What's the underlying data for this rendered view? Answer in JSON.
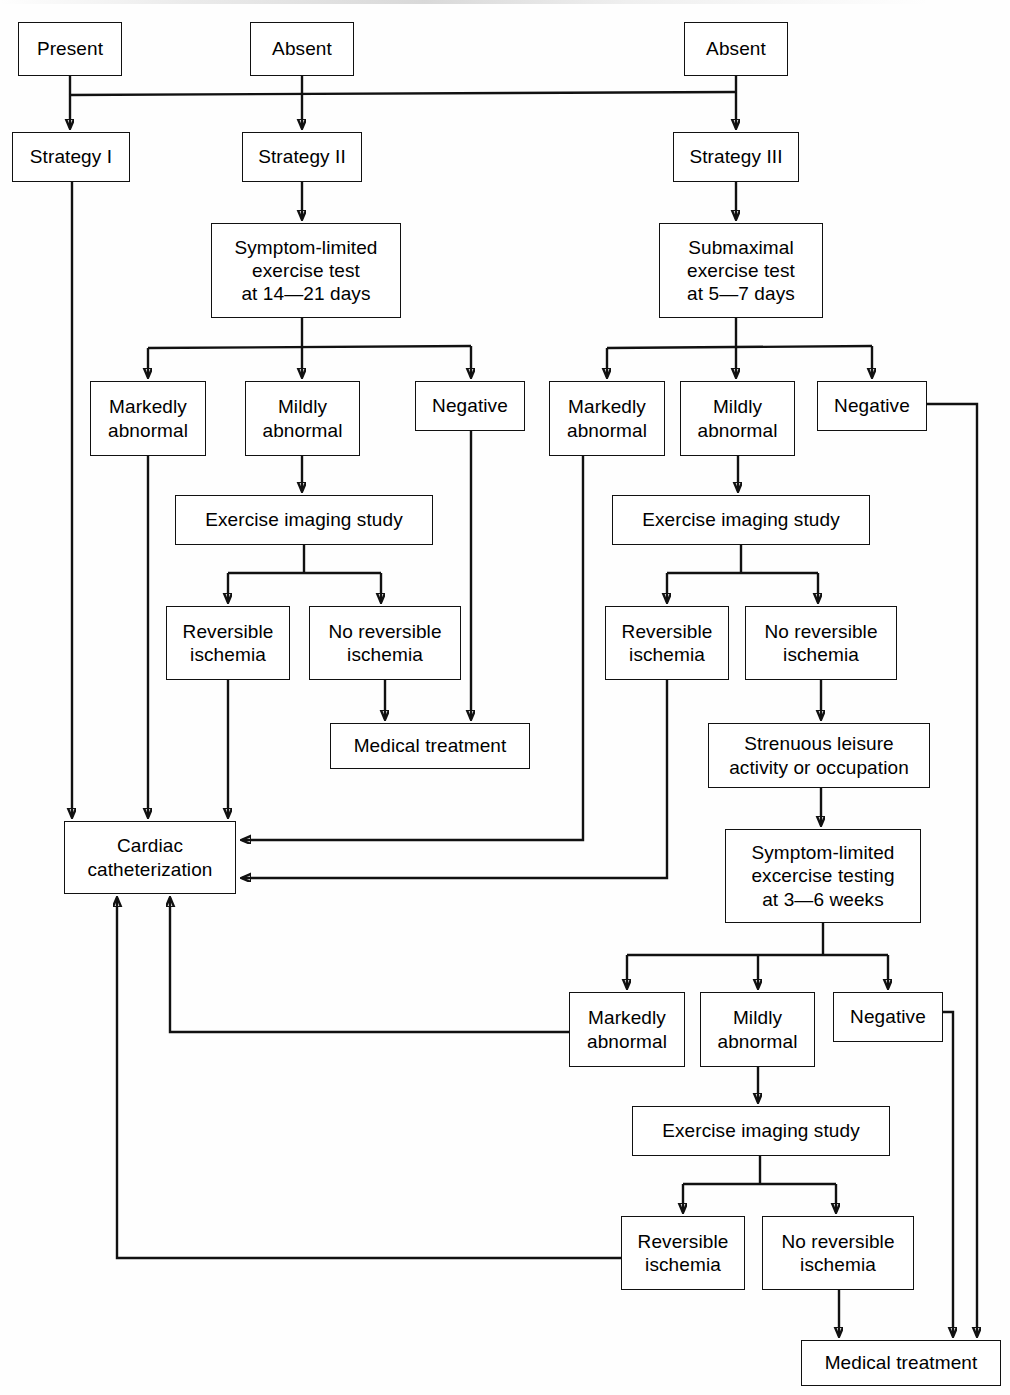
{
  "diagram": {
    "type": "flowchart",
    "nodes": [
      {
        "id": "present",
        "label": "Present",
        "x": 18,
        "y": 22,
        "w": 104,
        "h": 54
      },
      {
        "id": "absent-ii",
        "label": "Absent",
        "x": 250,
        "y": 22,
        "w": 104,
        "h": 54
      },
      {
        "id": "absent-iii",
        "label": "Absent",
        "x": 684,
        "y": 22,
        "w": 104,
        "h": 54
      },
      {
        "id": "strategy-1",
        "label": "Strategy I",
        "x": 12,
        "y": 132,
        "w": 118,
        "h": 50
      },
      {
        "id": "strategy-2",
        "label": "Strategy II",
        "x": 242,
        "y": 132,
        "w": 120,
        "h": 50
      },
      {
        "id": "strategy-3",
        "label": "Strategy III",
        "x": 673,
        "y": 132,
        "w": 126,
        "h": 50
      },
      {
        "id": "sym-limited-14",
        "label": "Symptom-limited\nexercise test\nat 14—21 days",
        "x": 211,
        "y": 223,
        "w": 190,
        "h": 95
      },
      {
        "id": "submaximal-5",
        "label": "Submaximal\nexercise test\nat 5—7 days",
        "x": 659,
        "y": 223,
        "w": 164,
        "h": 95
      },
      {
        "id": "mark-abn-2",
        "label": "Markedly\nabnormal",
        "x": 90,
        "y": 381,
        "w": 116,
        "h": 75
      },
      {
        "id": "mild-abn-2",
        "label": "Mildly\nabnormal",
        "x": 245,
        "y": 381,
        "w": 115,
        "h": 75
      },
      {
        "id": "negative-2",
        "label": "Negative",
        "x": 415,
        "y": 381,
        "w": 110,
        "h": 50
      },
      {
        "id": "mark-abn-3",
        "label": "Markedly\nabnormal",
        "x": 549,
        "y": 381,
        "w": 116,
        "h": 75
      },
      {
        "id": "mild-abn-3",
        "label": "Mildly\nabnormal",
        "x": 680,
        "y": 381,
        "w": 115,
        "h": 75
      },
      {
        "id": "negative-3",
        "label": "Negative",
        "x": 817,
        "y": 381,
        "w": 110,
        "h": 50
      },
      {
        "id": "eis-2",
        "label": "Exercise imaging study",
        "x": 175,
        "y": 495,
        "w": 258,
        "h": 50
      },
      {
        "id": "eis-3",
        "label": "Exercise imaging study",
        "x": 612,
        "y": 495,
        "w": 258,
        "h": 50
      },
      {
        "id": "rev-isch-2",
        "label": "Reversible\nischemia",
        "x": 166,
        "y": 606,
        "w": 124,
        "h": 74
      },
      {
        "id": "no-rev-isch-2",
        "label": "No reversible\nischemia",
        "x": 309,
        "y": 606,
        "w": 152,
        "h": 74
      },
      {
        "id": "rev-isch-3",
        "label": "Reversible\nischemia",
        "x": 605,
        "y": 606,
        "w": 124,
        "h": 74
      },
      {
        "id": "no-rev-isch-3",
        "label": "No reversible\nischemia",
        "x": 745,
        "y": 606,
        "w": 152,
        "h": 74
      },
      {
        "id": "med-treat-2",
        "label": "Medical treatment",
        "x": 330,
        "y": 723,
        "w": 200,
        "h": 46
      },
      {
        "id": "strenuous",
        "label": "Strenuous leisure\nactivity or occupation",
        "x": 708,
        "y": 723,
        "w": 222,
        "h": 65
      },
      {
        "id": "cardiac-cath",
        "label": "Cardiac\ncatheterization",
        "x": 64,
        "y": 821,
        "w": 172,
        "h": 73
      },
      {
        "id": "sym-limited-3",
        "label": "Symptom-limited\nexcercise testing\nat 3—6 weeks",
        "x": 725,
        "y": 829,
        "w": 196,
        "h": 94
      },
      {
        "id": "mark-abn-4",
        "label": "Markedly\nabnormal",
        "x": 569,
        "y": 992,
        "w": 116,
        "h": 75
      },
      {
        "id": "mild-abn-4",
        "label": "Mildly\nabnormal",
        "x": 700,
        "y": 992,
        "w": 115,
        "h": 75
      },
      {
        "id": "negative-4",
        "label": "Negative",
        "x": 833,
        "y": 992,
        "w": 110,
        "h": 50
      },
      {
        "id": "eis-4",
        "label": "Exercise imaging study",
        "x": 632,
        "y": 1106,
        "w": 258,
        "h": 50
      },
      {
        "id": "rev-isch-4",
        "label": "Reversible\nischemia",
        "x": 621,
        "y": 1216,
        "w": 124,
        "h": 74
      },
      {
        "id": "no-rev-isch-4",
        "label": "No reversible\nischemia",
        "x": 762,
        "y": 1216,
        "w": 152,
        "h": 74
      },
      {
        "id": "med-treat-4",
        "label": "Medical treatment",
        "x": 801,
        "y": 1340,
        "w": 200,
        "h": 46
      }
    ],
    "edges": [
      {
        "from": "present",
        "to": "strategy-1",
        "kind": "vertical-arrow"
      },
      {
        "from": "absent-ii",
        "to": "strategy-2",
        "kind": "vertical-arrow"
      },
      {
        "from": "absent-iii",
        "to": "strategy-3",
        "kind": "vertical-arrow"
      },
      {
        "from": "absent-iii",
        "to": "present",
        "kind": "horizontal-bus"
      },
      {
        "from": "strategy-2",
        "to": "sym-limited-14",
        "kind": "vertical-arrow"
      },
      {
        "from": "strategy-3",
        "to": "submaximal-5",
        "kind": "vertical-arrow"
      },
      {
        "from": "sym-limited-14",
        "to": "mark-abn-2",
        "kind": "branch"
      },
      {
        "from": "sym-limited-14",
        "to": "mild-abn-2",
        "kind": "branch"
      },
      {
        "from": "sym-limited-14",
        "to": "negative-2",
        "kind": "branch"
      },
      {
        "from": "submaximal-5",
        "to": "mark-abn-3",
        "kind": "branch"
      },
      {
        "from": "submaximal-5",
        "to": "mild-abn-3",
        "kind": "branch"
      },
      {
        "from": "submaximal-5",
        "to": "negative-3",
        "kind": "branch"
      },
      {
        "from": "mild-abn-2",
        "to": "eis-2",
        "kind": "vertical-arrow"
      },
      {
        "from": "eis-2",
        "to": "rev-isch-2",
        "kind": "branch"
      },
      {
        "from": "eis-2",
        "to": "no-rev-isch-2",
        "kind": "branch"
      },
      {
        "from": "no-rev-isch-2",
        "to": "med-treat-2",
        "kind": "vertical-arrow"
      },
      {
        "from": "negative-2",
        "to": "med-treat-2",
        "kind": "vertical-arrow"
      },
      {
        "from": "strategy-1",
        "to": "cardiac-cath",
        "kind": "vertical-arrow"
      },
      {
        "from": "mark-abn-2",
        "to": "cardiac-cath",
        "kind": "vertical-arrow"
      },
      {
        "from": "rev-isch-2",
        "to": "cardiac-cath",
        "kind": "vertical-arrow"
      },
      {
        "from": "mark-abn-3",
        "to": "cardiac-cath",
        "kind": "elbow-left"
      },
      {
        "from": "rev-isch-3",
        "to": "cardiac-cath",
        "kind": "elbow-left"
      },
      {
        "from": "mild-abn-3",
        "to": "eis-3",
        "kind": "vertical-arrow"
      },
      {
        "from": "eis-3",
        "to": "rev-isch-3",
        "kind": "branch"
      },
      {
        "from": "eis-3",
        "to": "no-rev-isch-3",
        "kind": "branch"
      },
      {
        "from": "no-rev-isch-3",
        "to": "strenuous",
        "kind": "vertical-arrow"
      },
      {
        "from": "strenuous",
        "to": "sym-limited-3",
        "kind": "vertical-arrow"
      },
      {
        "from": "negative-3",
        "to": "med-treat-4",
        "kind": "elbow-down"
      },
      {
        "from": "sym-limited-3",
        "to": "mark-abn-4",
        "kind": "branch"
      },
      {
        "from": "sym-limited-3",
        "to": "mild-abn-4",
        "kind": "branch"
      },
      {
        "from": "sym-limited-3",
        "to": "negative-4",
        "kind": "branch"
      },
      {
        "from": "mark-abn-4",
        "to": "cardiac-cath",
        "kind": "elbow-up-left"
      },
      {
        "from": "mild-abn-4",
        "to": "eis-4",
        "kind": "vertical-arrow"
      },
      {
        "from": "eis-4",
        "to": "rev-isch-4",
        "kind": "branch"
      },
      {
        "from": "eis-4",
        "to": "no-rev-isch-4",
        "kind": "branch"
      },
      {
        "from": "rev-isch-4",
        "to": "cardiac-cath",
        "kind": "elbow-up-left"
      },
      {
        "from": "no-rev-isch-4",
        "to": "med-treat-4",
        "kind": "vertical-arrow"
      },
      {
        "from": "negative-4",
        "to": "med-treat-4",
        "kind": "elbow-down"
      }
    ]
  },
  "colors": {
    "stroke": "#111111",
    "box_fill": "#ffffff",
    "text": "#000000",
    "page_background": "#fefefe"
  }
}
